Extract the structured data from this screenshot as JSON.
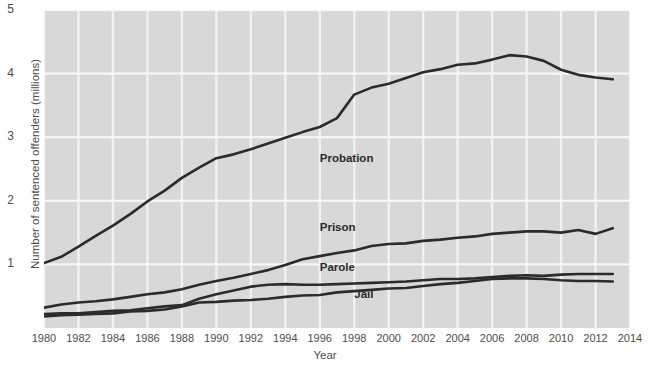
{
  "chart_data": {
    "type": "line",
    "title": "",
    "xlabel": "Year",
    "ylabel": "Number of sentenced offenders (millions)",
    "xlim": [
      1980,
      2014
    ],
    "ylim": [
      0,
      5
    ],
    "xticks": [
      "1980",
      "1982",
      "1984",
      "1986",
      "1988",
      "1990",
      "1992",
      "1994",
      "1996",
      "1998",
      "2000",
      "2002",
      "2004",
      "2006",
      "2008",
      "2010",
      "2012",
      "2014"
    ],
    "yticks": [
      "1",
      "2",
      "3",
      "4",
      "5"
    ],
    "grid": true,
    "legend_position": "inline-annotations",
    "plot_background": "#d8d8d8",
    "gridline_color": "#f2f2f2",
    "line_color": "#2b2b2b",
    "x": [
      1980,
      1981,
      1982,
      1983,
      1984,
      1985,
      1986,
      1987,
      1988,
      1989,
      1990,
      1991,
      1992,
      1993,
      1994,
      1995,
      1996,
      1997,
      1998,
      1999,
      2000,
      2001,
      2002,
      2003,
      2004,
      2005,
      2006,
      2007,
      2008,
      2009,
      2010,
      2011,
      2012,
      2013
    ],
    "series": [
      {
        "name": "Probation",
        "values": [
          1.02,
          1.12,
          1.28,
          1.45,
          1.61,
          1.79,
          1.99,
          2.16,
          2.36,
          2.52,
          2.67,
          2.73,
          2.81,
          2.9,
          2.99,
          3.08,
          3.16,
          3.3,
          3.67,
          3.78,
          3.84,
          3.93,
          4.02,
          4.07,
          4.14,
          4.16,
          4.22,
          4.29,
          4.27,
          4.2,
          4.06,
          3.98,
          3.94,
          3.91
        ],
        "label_x": 1996,
        "label_y": 2.65
      },
      {
        "name": "Prison",
        "values": [
          0.32,
          0.37,
          0.4,
          0.42,
          0.45,
          0.49,
          0.53,
          0.56,
          0.61,
          0.68,
          0.74,
          0.79,
          0.85,
          0.91,
          0.99,
          1.08,
          1.13,
          1.18,
          1.22,
          1.29,
          1.32,
          1.33,
          1.37,
          1.39,
          1.42,
          1.44,
          1.48,
          1.5,
          1.52,
          1.52,
          1.5,
          1.54,
          1.48,
          1.57
        ],
        "label_x": 1996,
        "label_y": 1.58
      },
      {
        "name": "Parole",
        "values": [
          0.22,
          0.23,
          0.23,
          0.25,
          0.27,
          0.28,
          0.31,
          0.34,
          0.36,
          0.46,
          0.53,
          0.59,
          0.65,
          0.68,
          0.69,
          0.68,
          0.68,
          0.69,
          0.7,
          0.71,
          0.72,
          0.73,
          0.75,
          0.77,
          0.77,
          0.78,
          0.8,
          0.82,
          0.83,
          0.82,
          0.84,
          0.85,
          0.85,
          0.85
        ],
        "label_x": 1996,
        "label_y": 0.95
      },
      {
        "name": "Jail",
        "values": [
          0.18,
          0.2,
          0.21,
          0.22,
          0.23,
          0.26,
          0.27,
          0.29,
          0.34,
          0.4,
          0.41,
          0.43,
          0.44,
          0.46,
          0.49,
          0.51,
          0.52,
          0.56,
          0.58,
          0.6,
          0.62,
          0.63,
          0.66,
          0.69,
          0.71,
          0.74,
          0.77,
          0.78,
          0.78,
          0.77,
          0.75,
          0.74,
          0.74,
          0.73
        ],
        "label_x": 1998,
        "label_y": 0.52
      }
    ]
  }
}
